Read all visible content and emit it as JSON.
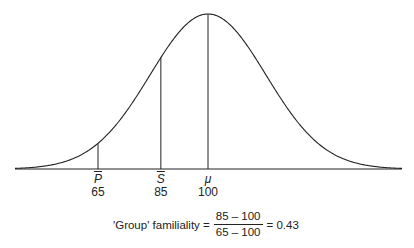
{
  "diagram": {
    "type": "normal-distribution",
    "mean": 100,
    "markers": [
      {
        "id": "p",
        "symbol": "P",
        "overbar": true,
        "value": "65",
        "x": 65
      },
      {
        "id": "s",
        "symbol": "S",
        "overbar": true,
        "value": "85",
        "x": 85
      },
      {
        "id": "mu",
        "symbol": "μ",
        "overbar": false,
        "value": "100",
        "x": 100
      }
    ],
    "formula": {
      "label": "'Group' familiality =",
      "numerator": "85 – 100",
      "denominator": "65 – 100",
      "result": "= 0.43"
    },
    "colors": {
      "line": "#222222",
      "background": "#ffffff"
    }
  }
}
